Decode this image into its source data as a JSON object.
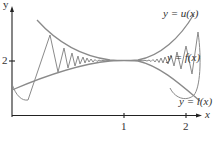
{
  "figure": {
    "axes": {
      "x_label": "x",
      "y_label": "y",
      "x_ticks": [
        "1",
        "2"
      ],
      "y_ticks": [
        "2"
      ]
    },
    "curves": {
      "upper": {
        "label": "y = u(x)",
        "color": "#8a8a8a"
      },
      "middle": {
        "label": "y = f(x)",
        "color": "#8a8a8a"
      },
      "lower": {
        "label": "y = l(x)",
        "color": "#8a8a8a"
      }
    },
    "colors": {
      "axis": "#222222",
      "curve": "#8a8a8a",
      "text": "#333333"
    }
  },
  "labels": {
    "u": "y = u(x)",
    "f": "y = f(x)",
    "l": "y = l(x)",
    "x_axis": "x",
    "y_axis": "y",
    "tick_x1": "1",
    "tick_x2": "2",
    "tick_y2": "2"
  }
}
